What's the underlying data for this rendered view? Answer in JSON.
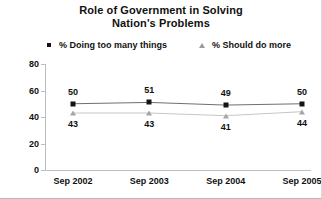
{
  "chart_data": {
    "type": "line",
    "title": "Role of Government in Solving Nation's Problems",
    "title_line1": "Role of Government in Solving",
    "title_line2": "Nation's Problems",
    "xlabel": "",
    "ylabel": "",
    "ylim": [
      0,
      80
    ],
    "yticks": [
      0,
      20,
      40,
      60,
      80
    ],
    "grid": false,
    "legend_position": "top",
    "categories": [
      "Sep 2002",
      "Sep 2003",
      "Sep 2004",
      "Sep 2005"
    ],
    "series": [
      {
        "name": "% Doing too many things",
        "marker": "square",
        "color": "#141414",
        "line_color": "#6f6f6f",
        "values": [
          50,
          51,
          49,
          50
        ],
        "labels": [
          "50",
          "51",
          "49",
          "50"
        ]
      },
      {
        "name": "% Should do more",
        "marker": "triangle",
        "color": "#a5a5a5",
        "line_color": "#c2c2c2",
        "values": [
          43,
          43,
          41,
          44
        ],
        "labels": [
          "43",
          "43",
          "41",
          "44"
        ]
      }
    ]
  },
  "legend": {
    "items": [
      {
        "label": "% Doing too many things",
        "marker": "square-marker-icon"
      },
      {
        "label": "% Should do more",
        "marker": "triangle-marker-icon"
      }
    ]
  },
  "axis": {
    "y_tick_labels": [
      "80",
      "60",
      "40",
      "20",
      "0"
    ],
    "x_tick_labels": [
      "Sep 2002",
      "Sep 2003",
      "Sep 2004",
      "Sep 2005"
    ]
  }
}
